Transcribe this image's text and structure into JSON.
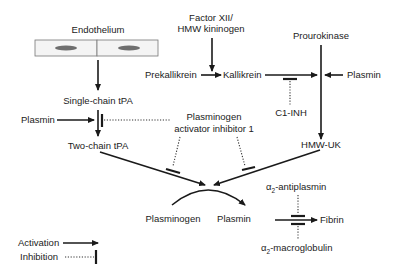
{
  "nodes": {
    "endothelium": "Endothelium",
    "factor_xii_line1": "Factor XII/",
    "factor_xii_line2": "HMW kininogen",
    "prourokinase": "Prourokinase",
    "prekallikrein": "Prekallikrein",
    "kallikrein": "Kallikrein",
    "plasmin_right": "Plasmin",
    "c1_inh": "C1-INH",
    "single_chain_tpa": "Single-chain tPA",
    "plasmin_left": "Plasmin",
    "pai1_line1": "Plasminogen",
    "pai1_line2": "activator inhibitor 1",
    "two_chain_tpa": "Two-chain tPA",
    "hmw_uk": "HMW-UK",
    "a2_antiplasmin_greek": "α",
    "a2_antiplasmin_sub": "2",
    "a2_antiplasmin_rest": "-antiplasmin",
    "plasminogen": "Plasminogen",
    "plasmin_center": "Plasmin",
    "fibrin": "Fibrin",
    "a2_macroglobulin_greek": "α",
    "a2_macroglobulin_sub": "2",
    "a2_macroglobulin_rest": "-macroglobulin"
  },
  "legend": {
    "activation": "Activation",
    "inhibition": "Inhibition"
  },
  "colors": {
    "line": "#1a1a1a",
    "cell_fill": "#f4f4f4",
    "nucleus": "#6e6e6e"
  }
}
